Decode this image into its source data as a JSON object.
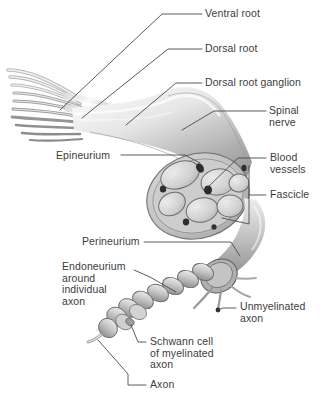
{
  "figure": {
    "background_color": "#ffffff",
    "ink_color": "#3c3c3c",
    "illustration_style": "grayscale anatomical drawing"
  },
  "labels": [
    {
      "id": "ventral-root",
      "text": "Ventral root",
      "x": 205,
      "y": 10
    },
    {
      "id": "dorsal-root",
      "text": "Dorsal root",
      "x": 205,
      "y": 45
    },
    {
      "id": "dorsal-root-ganglion",
      "text": "Dorsal root ganglion",
      "x": 205,
      "y": 79
    },
    {
      "id": "spinal-nerve",
      "text": "Spinal\nnerve",
      "x": 269,
      "y": 106
    },
    {
      "id": "epineurium",
      "text": "Epineurium",
      "x": 56,
      "y": 150
    },
    {
      "id": "blood-vessels",
      "text": "Blood\nvessels",
      "x": 270,
      "y": 153
    },
    {
      "id": "fascicle",
      "text": "Fascicle",
      "x": 270,
      "y": 192
    },
    {
      "id": "perineurium",
      "text": "Perineurium",
      "x": 82,
      "y": 239
    },
    {
      "id": "endoneurium",
      "text": "Endoneurium\naround\nindividual\naxon",
      "x": 62,
      "y": 264
    },
    {
      "id": "unmyelinated-axon",
      "text": "Unmyelinated\naxon",
      "x": 240,
      "y": 303
    },
    {
      "id": "schwann-cell",
      "text": "Schwann cell\nof myelinated\naxon",
      "x": 150,
      "y": 338
    },
    {
      "id": "axon",
      "text": "Axon",
      "x": 150,
      "y": 381
    }
  ],
  "structures": [
    {
      "id": "nerve-rootlets",
      "description": "fan of rootlet filaments at upper left"
    },
    {
      "id": "ganglion-bulge",
      "description": "swollen dorsal root ganglion"
    },
    {
      "id": "nerve-trunk",
      "description": "main spinal nerve trunk"
    },
    {
      "id": "cross-section",
      "description": "cut face showing fascicles, epineurium and blood vessels"
    },
    {
      "id": "fascicle-count",
      "description": "6 fascicles visible in cross section"
    },
    {
      "id": "branch-nerve",
      "description": "lower branch with cut fascicle end"
    },
    {
      "id": "myelinated-chain",
      "description": "chain of Schwann cell segments along one axon"
    },
    {
      "id": "unmyelinated-fiber",
      "description": "bare thin axon emerging from cut end"
    }
  ]
}
